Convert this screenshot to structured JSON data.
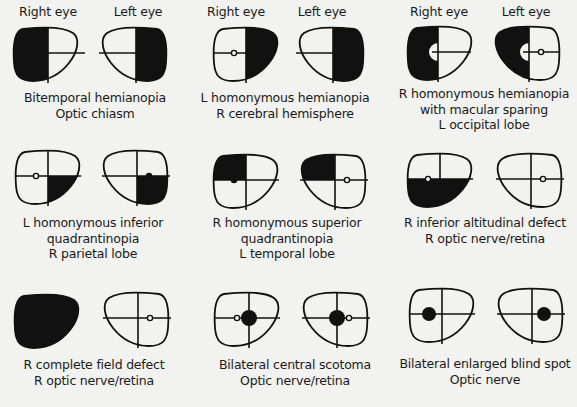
{
  "eye_labels": {
    "right": "Right eye",
    "left": "Left eye"
  },
  "panels": [
    {
      "title": "Bitemporal hemianopia",
      "lines": [
        "Bitemporal hemianopia",
        "Optic chiasm"
      ],
      "right_eye": "outer-half-black",
      "left_eye": "outer-half-black"
    },
    {
      "title": "L homonymous hemianopia",
      "lines": [
        "L homonymous hemianopia",
        "R cerebral hemisphere"
      ],
      "right_eye": "right-half-black",
      "left_eye": "right-half-black"
    },
    {
      "title": "R homonymous hemianopia with macular sparing",
      "lines": [
        "R homonymous hemianopia",
        "with macular sparing",
        "L occipital lobe"
      ],
      "right_eye": "left-half-black-macula-spared",
      "left_eye": "left-half-black-macula-spared"
    },
    {
      "title": "L homonymous inferior quadrantinopia",
      "lines": [
        "L homonymous inferior",
        "quadrantinopia",
        "R parietal lobe"
      ],
      "right_eye": "lower-right-quadrant-black",
      "left_eye": "lower-right-quadrant-black"
    },
    {
      "title": "R homonymous superior quadrantinopia",
      "lines": [
        "R homonymous superior",
        "quadrantinopia",
        "L temporal lobe"
      ],
      "right_eye": "upper-left-quadrant-black",
      "left_eye": "upper-left-quadrant-black"
    },
    {
      "title": "R inferior altitudinal defect",
      "lines": [
        "R inferior altitudinal defect",
        "R optic nerve/retina"
      ],
      "right_eye": "lower-half-black",
      "left_eye": "normal"
    },
    {
      "title": "R complete field defect",
      "lines": [
        "R complete field defect",
        "R optic nerve/retina"
      ],
      "right_eye": "all-black",
      "left_eye": "normal"
    },
    {
      "title": "Bilateral central scotoma",
      "lines": [
        "Bilateral central scotoma",
        "Optic nerve/retina"
      ],
      "right_eye": "central-scotoma",
      "left_eye": "central-scotoma"
    },
    {
      "title": "Bilateral enlarged blind spot",
      "lines": [
        "Bilateral enlarged blind spot",
        "Optic nerve"
      ],
      "right_eye": "enlarged-blind-spot",
      "left_eye": "enlarged-blind-spot"
    }
  ]
}
